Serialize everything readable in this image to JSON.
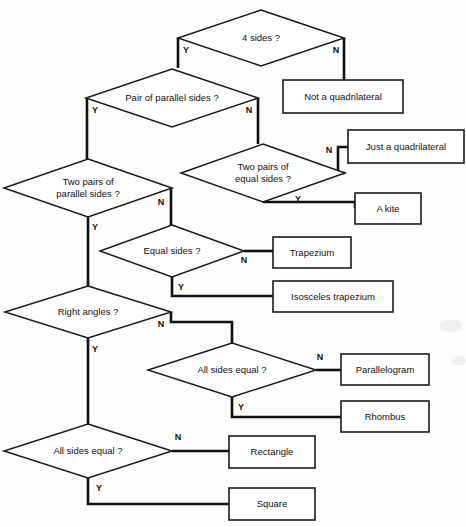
{
  "diagram": {
    "type": "decision-flowchart",
    "stroke_color": "#111111",
    "fill_color": "#ffffff",
    "background_color": "#fdfdfc",
    "yes_label": "Y",
    "no_label": "N",
    "decisions": [
      {
        "id": "four-sides",
        "text_lines": [
          "4 sides ?"
        ],
        "cx": 261,
        "cy": 38,
        "rx": 83,
        "ry": 28,
        "yes": {
          "label": "Y",
          "x": 186,
          "y": 51
        },
        "no": {
          "label": "N",
          "x": 336,
          "y": 51
        }
      },
      {
        "id": "pair-parallel-sides",
        "text_lines": [
          "Pair of parallel sides ?"
        ],
        "cx": 172,
        "cy": 98,
        "rx": 86,
        "ry": 29,
        "yes": {
          "label": "Y",
          "x": 95,
          "y": 111
        },
        "no": {
          "label": "N",
          "x": 249,
          "y": 111
        }
      },
      {
        "id": "two-pairs-equal-sides",
        "text_lines": [
          "Two pairs of",
          "equal sides ?"
        ],
        "cx": 263,
        "cy": 173,
        "rx": 82,
        "ry": 29,
        "yes": {
          "label": "Y",
          "x": 298,
          "y": 200
        },
        "no": {
          "label": "N",
          "x": 329,
          "y": 151
        }
      },
      {
        "id": "two-pairs-parallel-sides",
        "text_lines": [
          "Two pairs of",
          "parallel sides ?"
        ],
        "cx": 88,
        "cy": 188,
        "rx": 84,
        "ry": 29,
        "yes": {
          "label": "Y",
          "x": 95,
          "y": 228
        },
        "no": {
          "label": "N",
          "x": 161,
          "y": 203
        }
      },
      {
        "id": "equal-sides",
        "text_lines": [
          "Equal sides ?"
        ],
        "cx": 172,
        "cy": 251,
        "rx": 72,
        "ry": 26,
        "yes": {
          "label": "Y",
          "x": 181,
          "y": 288
        },
        "no": {
          "label": "N",
          "x": 244,
          "y": 261
        }
      },
      {
        "id": "right-angles",
        "text_lines": [
          "Right angles ?"
        ],
        "cx": 88,
        "cy": 312,
        "rx": 83,
        "ry": 26,
        "yes": {
          "label": "Y",
          "x": 95,
          "y": 350
        },
        "no": {
          "label": "N",
          "x": 161,
          "y": 325
        }
      },
      {
        "id": "all-sides-equal-upper",
        "text_lines": [
          "All sides equal ?"
        ],
        "cx": 232,
        "cy": 370,
        "rx": 84,
        "ry": 27,
        "yes": {
          "label": "Y",
          "x": 241,
          "y": 408
        },
        "no": {
          "label": "N",
          "x": 320,
          "y": 358
        }
      },
      {
        "id": "all-sides-equal-lower",
        "text_lines": [
          "All sides equal ?"
        ],
        "cx": 88,
        "cy": 451,
        "rx": 84,
        "ry": 27,
        "yes": {
          "label": "Y",
          "x": 99,
          "y": 489
        },
        "no": {
          "label": "N",
          "x": 178,
          "y": 438
        }
      }
    ],
    "results": [
      {
        "id": "not-a-quadrilateral",
        "text": "Not a quadrilateral",
        "x": 283,
        "y": 80,
        "w": 120,
        "h": 33
      },
      {
        "id": "just-a-quadrilateral",
        "text": "Just a quadrilateral",
        "x": 348,
        "y": 130,
        "w": 116,
        "h": 33
      },
      {
        "id": "a-kite",
        "text": "A kite",
        "x": 355,
        "y": 193,
        "w": 66,
        "h": 31
      },
      {
        "id": "trapezium",
        "text": "Trapezium",
        "x": 273,
        "y": 237,
        "w": 78,
        "h": 31
      },
      {
        "id": "isosceles-trapezium",
        "text": "Isosceles trapezium",
        "x": 273,
        "y": 281,
        "w": 120,
        "h": 31
      },
      {
        "id": "parallelogram",
        "text": "Parallelogram",
        "x": 341,
        "y": 354,
        "w": 88,
        "h": 31
      },
      {
        "id": "rhombus",
        "text": "Rhombus",
        "x": 341,
        "y": 401,
        "w": 88,
        "h": 31
      },
      {
        "id": "rectangle",
        "text": "Rectangle",
        "x": 229,
        "y": 436,
        "w": 86,
        "h": 32
      },
      {
        "id": "square",
        "text": "Square",
        "x": 229,
        "y": 488,
        "w": 86,
        "h": 32
      }
    ],
    "connectors": [
      {
        "id": "four-sides-no-to-not-a-quadrilateral",
        "from": "four-sides",
        "branch": "N",
        "to": "not-a-quadrilateral",
        "path": "M 344 38 L 344 80"
      },
      {
        "id": "four-sides-yes-to-pair-parallel",
        "from": "four-sides",
        "branch": "Y",
        "to": "pair-parallel-sides",
        "path": "M 178 38 L 178 68"
      },
      {
        "id": "pair-parallel-no-to-two-pairs-equal",
        "from": "pair-parallel-sides",
        "branch": "N",
        "to": "two-pairs-equal-sides",
        "path": "M 258 98 L 258 144"
      },
      {
        "id": "pair-parallel-yes-to-two-pairs-parallel",
        "from": "pair-parallel-sides",
        "branch": "Y",
        "to": "two-pairs-parallel-sides",
        "path": "M 87 98 L 87 159"
      },
      {
        "id": "two-pairs-equal-no-to-just-a-quadrilateral",
        "from": "two-pairs-equal-sides",
        "branch": "N",
        "to": "just-a-quadrilateral",
        "path": "M 345 173 L 338 173 L 338 147 L 348 147"
      },
      {
        "id": "two-pairs-equal-yes-to-a-kite",
        "from": "two-pairs-equal-sides",
        "branch": "Y",
        "to": "a-kite",
        "path": "M 263 202 L 355 202 L 355 208"
      },
      {
        "id": "two-pairs-parallel-no-to-equal-sides",
        "from": "two-pairs-parallel-sides",
        "branch": "N",
        "to": "equal-sides",
        "path": "M 171 188 L 171 226"
      },
      {
        "id": "two-pairs-parallel-yes-to-right-angles",
        "from": "two-pairs-parallel-sides",
        "branch": "Y",
        "to": "right-angles",
        "path": "M 88 217 L 88 286"
      },
      {
        "id": "equal-sides-no-to-trapezium",
        "from": "equal-sides",
        "branch": "N",
        "to": "trapezium",
        "path": "M 244 251 L 273 251"
      },
      {
        "id": "equal-sides-yes-to-isosceles-trapezium",
        "from": "equal-sides",
        "branch": "Y",
        "to": "isosceles-trapezium",
        "path": "M 172 277 L 172 296 L 273 296"
      },
      {
        "id": "right-angles-no-to-all-sides-equal-upper",
        "from": "right-angles",
        "branch": "N",
        "to": "all-sides-equal-upper",
        "path": "M 171 312 L 171 322 L 232 322 L 232 343"
      },
      {
        "id": "right-angles-yes-to-all-sides-equal-lower",
        "from": "right-angles",
        "branch": "Y",
        "to": "all-sides-equal-lower",
        "path": "M 88 338 L 88 424"
      },
      {
        "id": "all-sides-equal-upper-no-to-parallelogram",
        "from": "all-sides-equal-upper",
        "branch": "N",
        "to": "parallelogram",
        "path": "M 316 370 L 341 370"
      },
      {
        "id": "all-sides-equal-upper-yes-to-rhombus",
        "from": "all-sides-equal-upper",
        "branch": "Y",
        "to": "rhombus",
        "path": "M 232 397 L 232 417 L 341 417"
      },
      {
        "id": "all-sides-equal-lower-no-to-rectangle",
        "from": "all-sides-equal-lower",
        "branch": "N",
        "to": "rectangle",
        "path": "M 172 451 L 229 451"
      },
      {
        "id": "all-sides-equal-lower-yes-to-square",
        "from": "all-sides-equal-lower",
        "branch": "Y",
        "to": "square",
        "path": "M 88 478 L 88 504 L 229 504"
      }
    ]
  }
}
